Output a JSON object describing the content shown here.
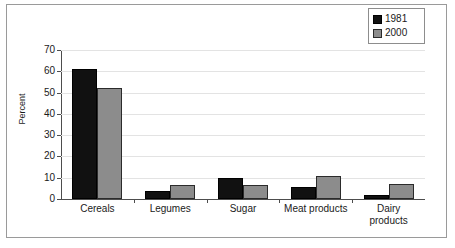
{
  "chart_data": {
    "type": "bar",
    "title": "",
    "subtitle": "",
    "xlabel": "",
    "ylabel": "Percent",
    "ylim": [
      0,
      70
    ],
    "ytick_step": 10,
    "yticks": [
      "70",
      "60",
      "50",
      "40",
      "30",
      "20",
      "10",
      "0"
    ],
    "ytick_values": [
      70,
      60,
      50,
      40,
      30,
      20,
      10,
      0
    ],
    "grid": true,
    "grid_axis": "y",
    "legend_position": "top-right",
    "categories": [
      "Cereals",
      "Legumes",
      "Sugar",
      "Meat products",
      "Dairy products"
    ],
    "category_label_lines": [
      [
        "Cereals"
      ],
      [
        "Legumes"
      ],
      [
        "Sugar"
      ],
      [
        "Meat products"
      ],
      [
        "Dairy",
        "products"
      ]
    ],
    "series": [
      {
        "name": "1981",
        "color": "#111111",
        "values": [
          61,
          4,
          10,
          5.5,
          2
        ]
      },
      {
        "name": "2000",
        "color": "#8c8c8c",
        "values": [
          52,
          6.5,
          6.5,
          11,
          7
        ]
      }
    ]
  },
  "legend": {
    "entries": [
      {
        "label": "1981",
        "swatch": "black-square-swatch"
      },
      {
        "label": "2000",
        "swatch": "gray-square-swatch"
      }
    ]
  },
  "axes": {
    "y_axis_title": "Percent",
    "y_axis_ticks": [
      "70",
      "60",
      "50",
      "40",
      "30",
      "20",
      "10",
      "0"
    ],
    "x_axis_ticks": [
      "Cereals",
      "Legumes",
      "Sugar",
      "Meat products",
      "Dairy products"
    ]
  },
  "colors": {
    "series_1981": "#111111",
    "series_2000": "#8c8c8c",
    "gridline": "#e3e3e3",
    "axis": "#4d4d4d",
    "frame": "#9a9a9a",
    "text": "#1a1a1a",
    "background": "#ffffff"
  }
}
